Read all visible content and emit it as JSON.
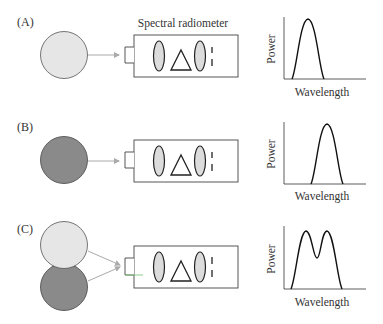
{
  "figure": {
    "instrument_label": "Spectral radiometer",
    "colors": {
      "light_source": "#e6e6e6",
      "dark_source": "#8a8a8a",
      "lens_fill": "#dcdcdc",
      "stroke": "#222222",
      "arrow": "#aaaaaa",
      "port_highlight": "#7fc77f"
    },
    "panels": [
      {
        "label": "(A)",
        "sources": [
          "light"
        ],
        "plot": {
          "ylabel": "Power",
          "xlabel": "Wavelength",
          "shape": "single peak, short wavelength"
        }
      },
      {
        "label": "(B)",
        "sources": [
          "dark"
        ],
        "plot": {
          "ylabel": "Power",
          "xlabel": "Wavelength",
          "shape": "single peak, longer wavelength"
        }
      },
      {
        "label": "(C)",
        "sources": [
          "light",
          "dark"
        ],
        "plot": {
          "ylabel": "Power",
          "xlabel": "Wavelength",
          "shape": "double peak (sum of A and B)"
        }
      }
    ]
  }
}
